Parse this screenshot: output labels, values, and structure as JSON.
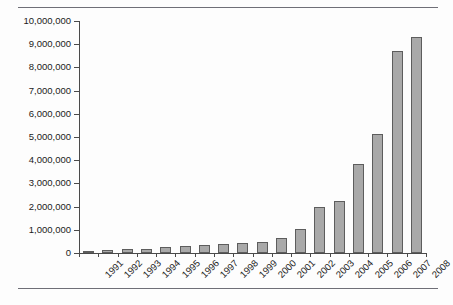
{
  "chart_data": {
    "type": "bar",
    "title": "",
    "subtitle": "",
    "xlabel": "",
    "ylabel": "",
    "categories": [
      "1991",
      "1992",
      "1993",
      "1994",
      "1995",
      "1996",
      "1997",
      "1998",
      "1999",
      "2000",
      "2001",
      "2002",
      "2003",
      "2004",
      "2005",
      "2006",
      "2007",
      "2008"
    ],
    "values": [
      80000,
      130000,
      180000,
      180000,
      260000,
      300000,
      340000,
      390000,
      430000,
      480000,
      650000,
      1050000,
      1980000,
      2230000,
      3850000,
      5150000,
      8700000,
      9330000
    ],
    "ylim": [
      0,
      10000000
    ],
    "ytick_labels": [
      "0",
      "1,000,000",
      "2,000,000",
      "3,000,000",
      "4,000,000",
      "5,000,000",
      "6,000,000",
      "7,000,000",
      "8,000,000",
      "9,000,000",
      "10,000,000"
    ],
    "ytick_values": [
      0,
      1000000,
      2000000,
      3000000,
      4000000,
      5000000,
      6000000,
      7000000,
      8000000,
      9000000,
      10000000
    ],
    "grid": false,
    "legend": null,
    "series_color": "#a9a9a9",
    "series_border_color": "#5d5d5d",
    "axis_color": "#4a4a4a",
    "rule_color": "#6f6f77"
  }
}
